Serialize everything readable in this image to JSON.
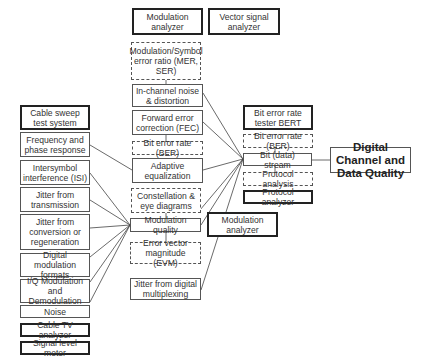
{
  "diagram": {
    "title": "Digital Channel and Data Quality",
    "instruments": {
      "modulation_analyzer_top": "Modulation analyzer",
      "vector_signal_analyzer": "Vector signal analyzer",
      "bert": "Bit error rate tester BERT",
      "protocol_analyzer": "Protocol analyzer",
      "modulation_analyzer_mid": "Modulation analyzer",
      "cable_sweep": "Cable sweep test system",
      "cable_tv_analyzer": "Cable TV analyzer",
      "signal_level_meter": "Signal level meter"
    },
    "center_column": {
      "mer_ser": "Modulation/Symbol error ratio (MER, SER)",
      "in_channel_noise": "In-channel noise & distortion",
      "fec": "Forward error correction (FEC)",
      "ber_left": "Bit error rate (BER)",
      "adaptive_eq": "Adaptive equalization",
      "constellation": "Constellation & eye diagrams",
      "modulation_quality": "Modulation quality",
      "evm": "Error vector magnitude (EVM)",
      "jitter_mux": "Jitter from digital multiplexing"
    },
    "right_column": {
      "ber_right": "Bit error rate (BER)",
      "bit_stream": "Bit (data) stream",
      "protocol_analysis": "Protocol analysis"
    },
    "left_column": {
      "freq_phase": "Frequency and phase response",
      "isi": "Intersymbol interference (ISI)",
      "jitter_transmission": "Jitter from transmission",
      "jitter_conversion": "Jitter from conversion or regeneration",
      "digital_mod_formats": "Digital modulation formats",
      "iq_mod": "I/Q Modulation and Demodulation",
      "noise": "Noise"
    }
  }
}
